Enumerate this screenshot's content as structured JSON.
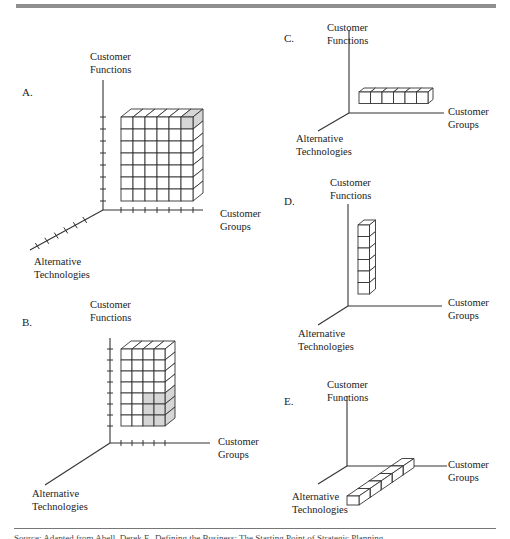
{
  "figure": {
    "top_rule": true,
    "source_note": "Source: Adapted from Abell, Derek F., Defining the Business: The Starting Point of Strategic Planning"
  },
  "axis_labels": {
    "functions": [
      "Customer",
      "Functions"
    ],
    "groups": [
      "Customer",
      "Groups"
    ],
    "technologies": [
      "Alternative",
      "Technologies"
    ]
  },
  "panels": [
    {
      "id": "A",
      "letter": "A.",
      "letter_pos": [
        22,
        96
      ],
      "origin": [
        103,
        210
      ],
      "functions_axis_len": 130,
      "groups_axis_len": 100,
      "tech_axis_end": [
        30,
        250
      ],
      "functions_ticks": 8,
      "groups_ticks": 7,
      "tech_ticks": 6,
      "block": {
        "cols": 6,
        "rows": 7,
        "x": 121,
        "y": 117,
        "cell": 12,
        "depth_dx": 10,
        "depth_dy": 8,
        "shaded_front": [
          [
            0,
            5
          ]
        ],
        "shaded_top": [
          5
        ],
        "shaded_side": []
      },
      "functions_label_pos": [
        90,
        60
      ],
      "groups_label_pos": [
        220,
        217
      ],
      "tech_label_pos": [
        34,
        265
      ]
    },
    {
      "id": "B",
      "letter": "B.",
      "letter_pos": [
        22,
        326
      ],
      "origin": [
        110,
        443
      ],
      "functions_axis_len": 105,
      "groups_axis_len": 100,
      "tech_axis_end": [
        45,
        485
      ],
      "functions_ticks": 8,
      "groups_ticks": 5,
      "tech_ticks": 0,
      "block": {
        "cols": 4,
        "rows": 7,
        "x": 121,
        "y": 349,
        "cell": 11,
        "depth_dx": 10,
        "depth_dy": 8,
        "shaded_front": [
          [
            4,
            2
          ],
          [
            4,
            3
          ],
          [
            5,
            2
          ],
          [
            5,
            3
          ],
          [
            6,
            2
          ],
          [
            6,
            3
          ]
        ],
        "shaded_top": [],
        "shaded_side": [
          4,
          5,
          6
        ]
      },
      "functions_label_pos": [
        90,
        308
      ],
      "groups_label_pos": [
        218,
        445
      ],
      "tech_label_pos": [
        32,
        497
      ]
    },
    {
      "id": "C",
      "letter": "C.",
      "letter_pos": [
        284,
        42
      ],
      "origin": [
        349,
        113
      ],
      "functions_axis_len": 83,
      "groups_axis_len": 95,
      "tech_axis_end": [
        318,
        131
      ],
      "functions_ticks": 0,
      "groups_ticks": 0,
      "tech_ticks": 0,
      "block": {
        "cols": 6,
        "rows": 1,
        "x": 359,
        "y": 92,
        "cell": 11.5,
        "depth_dx": 5,
        "depth_dy": 4,
        "shaded_front": [],
        "shaded_top": [],
        "shaded_side": []
      },
      "functions_label_pos": [
        327,
        31
      ],
      "groups_label_pos": [
        448,
        115
      ],
      "tech_label_pos": [
        296,
        142
      ]
    },
    {
      "id": "D",
      "letter": "D.",
      "letter_pos": [
        284,
        205
      ],
      "origin": [
        348,
        306
      ],
      "functions_axis_len": 102,
      "groups_axis_len": 94,
      "tech_axis_end": [
        318,
        325
      ],
      "functions_ticks": 0,
      "groups_ticks": 0,
      "tech_ticks": 0,
      "block": {
        "cols": 1,
        "rows": 6,
        "x": 358,
        "y": 225,
        "cell": 11.5,
        "depth_dx": 6,
        "depth_dy": 5,
        "shaded_front": [],
        "shaded_top": [],
        "shaded_side": []
      },
      "functions_label_pos": [
        330,
        186
      ],
      "groups_label_pos": [
        448,
        306
      ],
      "tech_label_pos": [
        298,
        337
      ]
    },
    {
      "id": "E",
      "letter": "E.",
      "letter_pos": [
        284,
        405
      ],
      "origin": [
        347,
        466
      ],
      "functions_axis_len": 70,
      "groups_axis_len": 100,
      "tech_axis_end": [
        318,
        484
      ],
      "functions_ticks": 0,
      "groups_ticks": 0,
      "tech_ticks": 0,
      "diagonal_row": {
        "count": 5,
        "start": [
          347,
          496
        ],
        "step_dx": 11,
        "step_dy": -7.5,
        "w": 12,
        "h": 9,
        "depth_dx": 4,
        "depth_dy": 3
      },
      "functions_label_pos": [
        327,
        388
      ],
      "groups_label_pos": [
        448,
        468
      ],
      "tech_label_pos": [
        292,
        500
      ]
    }
  ]
}
